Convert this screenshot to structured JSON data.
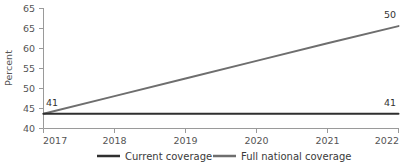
{
  "chart_data": {
    "type": "line",
    "title": "",
    "xlabel": "",
    "ylabel": "Percent",
    "x": [
      2017,
      2018,
      2019,
      2020,
      2021,
      2022
    ],
    "xtick_labels": [
      "2017",
      "2018",
      "2019",
      "2020",
      "2021",
      "2022"
    ],
    "ytick_labels": [
      "65",
      "65",
      "60",
      "55",
      "50",
      "45",
      "40"
    ],
    "ytick_values": [
      70,
      65,
      60,
      55,
      50,
      45,
      40
    ],
    "ylim": [
      40,
      70
    ],
    "xlim": [
      2017,
      2022
    ],
    "grid": false,
    "legend_position": "bottom",
    "series": [
      {
        "name": "Current coverage",
        "color": "#2f2f2f",
        "values": [
          43.7,
          43.7,
          43.7,
          43.7,
          43.7,
          43.7
        ],
        "start_label": "41",
        "end_label": "41"
      },
      {
        "name": "Full national coverage",
        "color": "#6e6e6e",
        "values": [
          43.7,
          48.1,
          52.5,
          56.9,
          61.3,
          65.6
        ],
        "start_label": "41",
        "end_label": "50"
      }
    ],
    "annotations": [
      {
        "text": "41",
        "series": "Current coverage",
        "position": "start"
      },
      {
        "text": "41",
        "series": "Current coverage",
        "position": "end"
      },
      {
        "text": "50",
        "series": "Full national coverage",
        "position": "end"
      }
    ]
  },
  "legend": {
    "items": [
      {
        "label": "Current coverage",
        "color": "#2f2f2f"
      },
      {
        "label": "Full national coverage",
        "color": "#6e6e6e"
      }
    ]
  },
  "axes": {
    "y_title": "Percent"
  }
}
